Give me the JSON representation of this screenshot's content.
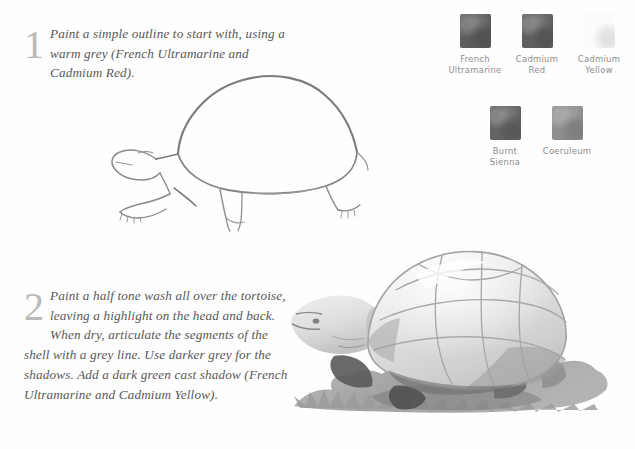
{
  "page": {
    "background_color": "#fefefe"
  },
  "steps": [
    {
      "number": "1",
      "text": "Paint a simple outline to start with, using a warm grey (French Ultramarine and Cadmium Red)."
    },
    {
      "number": "2",
      "text": "Paint a half tone wash all over the tortoise, leaving a highlight on the head and back. When dry, articulate the segments of the shell with a grey line. Use darker grey for the shadows. Add a dark green cast shadow (French Ultramarine and Cadmium Yellow)."
    }
  ],
  "palette": {
    "row1": [
      {
        "label": "French\nUltramarine",
        "color": "#5d5d5d"
      },
      {
        "label": "Cadmium\nRed",
        "color": "#5f5f5f"
      },
      {
        "label": "Cadmium\nYellow",
        "color": "#fbfbfb"
      }
    ],
    "row2": [
      {
        "label": "Burnt\nSienna",
        "color": "#636363"
      },
      {
        "label": "Coeruleum",
        "color": "#8e8e8e"
      }
    ]
  },
  "illustrations": {
    "outline": {
      "name": "Outline sketch of tortoise",
      "line_color": "#8a8a8a",
      "accent_color": "#6a6a6a"
    },
    "painted": {
      "name": "Half-tone washed tortoise with cast shadow",
      "wash_color": "#d8d8d8",
      "shell_line_color": "#9a9a9a",
      "shadow_color": "#5a5a5a",
      "cast_shadow_color": "#9b9b9b"
    }
  }
}
